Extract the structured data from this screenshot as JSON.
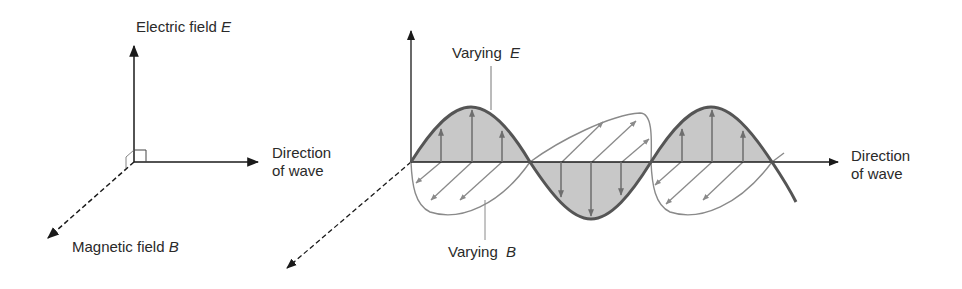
{
  "left_diagram": {
    "electric_label": "Electric field",
    "electric_symbol": "E",
    "direction_line1": "Direction",
    "direction_line2": "of wave",
    "magnetic_label": "Magnetic field",
    "magnetic_symbol": "B"
  },
  "right_diagram": {
    "varying_e_label": "Varying",
    "varying_e_symbol": "E",
    "varying_b_label": "Varying",
    "varying_b_symbol": "B",
    "direction_line1": "Direction",
    "direction_line2": "of wave"
  },
  "colors": {
    "axis": "#1a1a1a",
    "e_wave": "#555555",
    "e_fill": "#c8c8c8",
    "b_wave": "#8a8a8a",
    "arrow_gray": "#777777"
  }
}
